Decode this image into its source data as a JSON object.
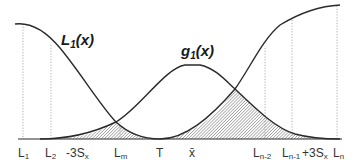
{
  "diagram": {
    "curves": [
      {
        "id": "L1",
        "label_main": "L",
        "label_sub": "1",
        "label_suffix": "(x)",
        "shape": "U-shaped loss function, minimum at T"
      },
      {
        "id": "g1",
        "label_main": "g",
        "label_sub": "1",
        "label_suffix": "(x)",
        "shape": "bell curve centered at x-bar"
      }
    ],
    "axis_labels": [
      {
        "id": "L1",
        "main": "L",
        "sub": "1"
      },
      {
        "id": "L2",
        "main": "L",
        "sub": "2"
      },
      {
        "id": "minus3Sx",
        "main": "-3S",
        "sub": "x"
      },
      {
        "id": "Lm",
        "main": "L",
        "sub": "m"
      },
      {
        "id": "T",
        "main": "T",
        "sub": ""
      },
      {
        "id": "xbar",
        "main": "x̄",
        "sub": ""
      },
      {
        "id": "Ln2",
        "main": "L",
        "sub": "n-2"
      },
      {
        "id": "Ln1",
        "main": "L",
        "sub": "n-1"
      },
      {
        "id": "plus3Sx",
        "main": "+3S",
        "sub": "x"
      },
      {
        "id": "Ln",
        "main": "L",
        "sub": "n"
      }
    ],
    "colors": {
      "curve": "#2a2a2a",
      "guide": "#9a9a9a",
      "hatch": "#6f6f6f"
    }
  }
}
